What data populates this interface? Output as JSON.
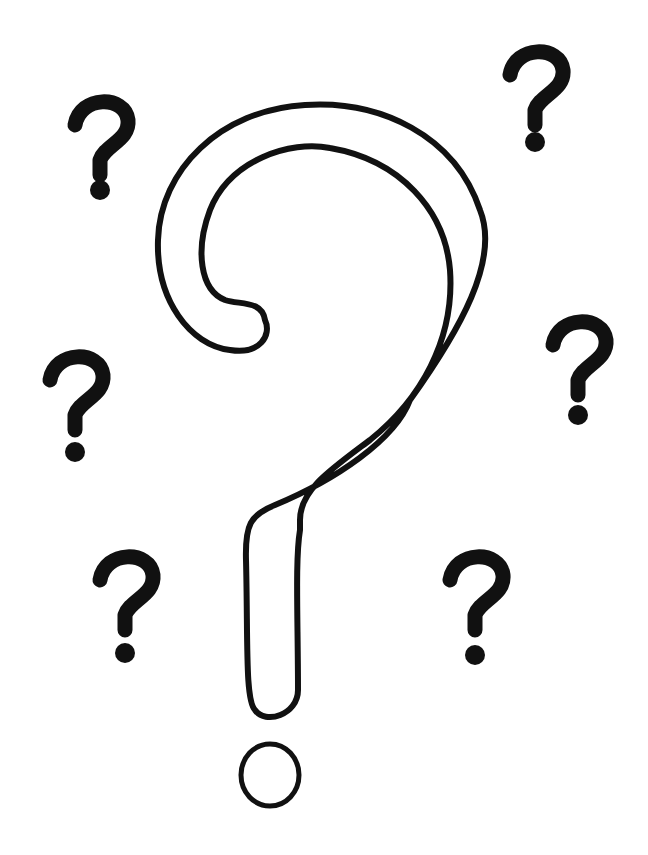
{
  "illustration": {
    "subject": "question-marks",
    "background_color": "#ffffff",
    "ink_color": "#111111",
    "big_question_mark": {
      "style": "outline",
      "x": 160,
      "y": 100,
      "width": 350,
      "height": 715
    },
    "small_question_marks": [
      {
        "x": 100,
        "y": 150
      },
      {
        "x": 535,
        "y": 100
      },
      {
        "x": 75,
        "y": 405
      },
      {
        "x": 578,
        "y": 370
      },
      {
        "x": 125,
        "y": 605
      },
      {
        "x": 475,
        "y": 605
      }
    ]
  }
}
